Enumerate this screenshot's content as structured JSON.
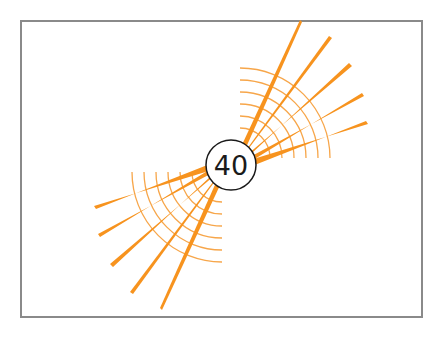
{
  "badge": {
    "value": "40"
  },
  "colors": {
    "accent": "#f7931e",
    "arc": "#f7a64a",
    "border": "#8a8a8a",
    "text": "#1a1a1a"
  },
  "icon": "speed-burst-icon"
}
